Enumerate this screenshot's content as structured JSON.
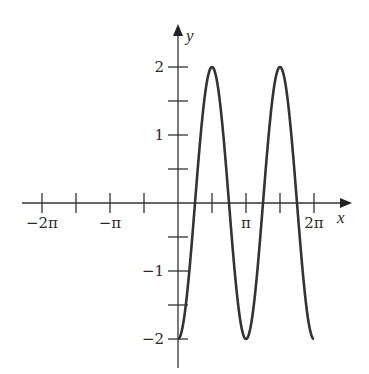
{
  "chart_data": {
    "type": "line",
    "title": "",
    "xlabel": "x",
    "ylabel": "y",
    "function": "y = -2cos(2x)",
    "x_domain_plotted": [
      0,
      6.2832
    ],
    "xlim": [
      -6.9,
      7.9
    ],
    "ylim": [
      -2.4,
      2.6
    ],
    "grid": false,
    "legend": null,
    "x_ticks": [
      {
        "value": -6.2832,
        "label": "−2π"
      },
      {
        "value": -4.7124,
        "label": ""
      },
      {
        "value": -3.1416,
        "label": "−π"
      },
      {
        "value": -1.5708,
        "label": ""
      },
      {
        "value": 1.5708,
        "label": ""
      },
      {
        "value": 3.1416,
        "label": "π"
      },
      {
        "value": 4.7124,
        "label": ""
      },
      {
        "value": 6.2832,
        "label": "2π"
      }
    ],
    "y_ticks": [
      {
        "value": 2,
        "label": "2"
      },
      {
        "value": 1.5,
        "label": ""
      },
      {
        "value": 1,
        "label": "1"
      },
      {
        "value": 0.5,
        "label": ""
      },
      {
        "value": -0.5,
        "label": ""
      },
      {
        "value": -1,
        "label": "−1"
      },
      {
        "value": -1.5,
        "label": ""
      },
      {
        "value": -2,
        "label": "−2"
      }
    ],
    "series": [
      {
        "name": "y = -2cos(2x)",
        "x": [
          0,
          0.7854,
          1.5708,
          2.3562,
          3.1416,
          3.927,
          4.7124,
          5.4978,
          6.2832
        ],
        "values": [
          -2,
          0,
          2,
          0,
          -2,
          0,
          2,
          0,
          -2
        ]
      }
    ]
  },
  "labels": {
    "x_axis": "x",
    "y_axis": "y"
  }
}
